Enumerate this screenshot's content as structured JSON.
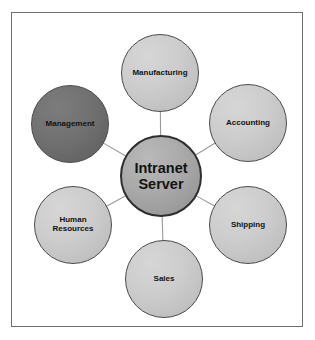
{
  "top_caption": "",
  "diagram": {
    "colors": {
      "frame_border": "#6f6f6f",
      "background": "#ffffff",
      "node_light_fill": "#c8c8c8",
      "node_dark_fill": "#6b6b6b",
      "node_hub_fill": "#a3a3a3",
      "node_stroke": "#4a4a4a",
      "connector": "#9a9a9a",
      "label_text": "#121212"
    },
    "hub": {
      "id": "intranet-server",
      "label": "Intranet Server",
      "label_lines": [
        "Intranet",
        "Server"
      ],
      "style": "hub",
      "cx": 161,
      "cy": 176,
      "r": 41
    },
    "nodes": [
      {
        "id": "manufacturing",
        "label": "Manufacturing",
        "label_lines": [
          "Manufacturing"
        ],
        "style": "light",
        "cx": 160,
        "cy": 73,
        "r": 39
      },
      {
        "id": "accounting",
        "label": "Accounting",
        "label_lines": [
          "Accounting"
        ],
        "style": "light",
        "cx": 248,
        "cy": 123,
        "r": 39
      },
      {
        "id": "shipping",
        "label": "Shipping",
        "label_lines": [
          "Shipping"
        ],
        "style": "light",
        "cx": 248,
        "cy": 225,
        "r": 39
      },
      {
        "id": "sales",
        "label": "Sales",
        "label_lines": [
          "Sales"
        ],
        "style": "light",
        "cx": 164,
        "cy": 279,
        "r": 39
      },
      {
        "id": "human-resources",
        "label": "Human Resources",
        "label_lines": [
          "Human",
          "Resources"
        ],
        "style": "light",
        "cx": 73,
        "cy": 225,
        "r": 39
      },
      {
        "id": "management",
        "label": "Management",
        "label_lines": [
          "Management"
        ],
        "style": "dark",
        "cx": 70,
        "cy": 124,
        "r": 39
      }
    ],
    "connectors": [
      {
        "from": "intranet-server",
        "to": "manufacturing"
      },
      {
        "from": "intranet-server",
        "to": "accounting"
      },
      {
        "from": "intranet-server",
        "to": "shipping"
      },
      {
        "from": "intranet-server",
        "to": "sales"
      },
      {
        "from": "intranet-server",
        "to": "human-resources"
      },
      {
        "from": "intranet-server",
        "to": "management"
      }
    ]
  }
}
